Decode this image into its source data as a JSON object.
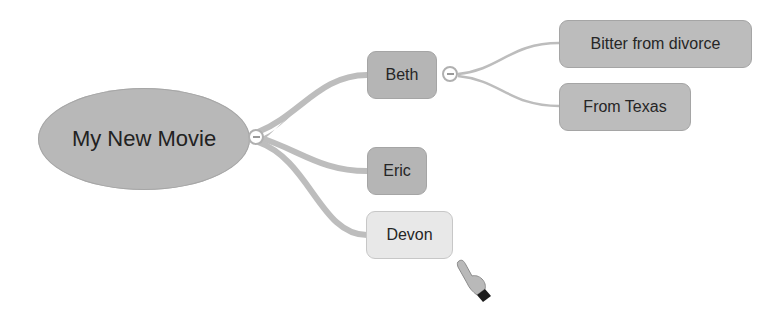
{
  "mindmap": {
    "root": {
      "label": "My New Movie"
    },
    "children": [
      {
        "label": "Beth",
        "collapsed": false,
        "children": [
          {
            "label": "Bitter from divorce"
          },
          {
            "label": "From Texas"
          }
        ]
      },
      {
        "label": "Eric"
      },
      {
        "label": "Devon",
        "selected": true
      }
    ],
    "toggle_icon": "minus-circle-icon",
    "cursor_icon": "pointing-hand-cursor-icon"
  },
  "colors": {
    "node_fill": "#b5b5b5",
    "selected_fill": "#e8e8e8",
    "link": "#b8b8b8",
    "text": "#262626"
  }
}
